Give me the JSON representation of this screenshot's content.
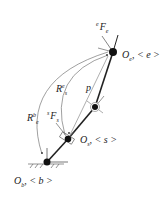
{
  "diagram": {
    "title": "",
    "colors": {
      "stroke": "#222222",
      "thin": "#555555",
      "background": "#ffffff"
    },
    "frames": {
      "end_effector": {
        "label_main": "O",
        "label_sub": "e",
        "label_tag": ", < e >",
        "x": 113,
        "y": 52
      },
      "sensor": {
        "label_main": "O",
        "label_sub": "s",
        "label_tag": ", < s >",
        "x": 68,
        "y": 139
      },
      "intermediate": {
        "x": 95,
        "y": 107
      },
      "base": {
        "label_main": "O",
        "label_sub": "b",
        "label_tag": ", < b >",
        "x": 47,
        "y": 162
      }
    },
    "labels": {
      "force_end": {
        "pre": "e",
        "main": "F",
        "sub": "e"
      },
      "force_sensor": {
        "pre": "s",
        "main": "F",
        "sub": "s"
      },
      "rot_es": {
        "main": "R",
        "sup": "e",
        "sub": "s"
      },
      "rot_eb": {
        "main": "R",
        "sup": "b",
        "sub": "e"
      },
      "vector_p": {
        "main": "p"
      }
    }
  }
}
